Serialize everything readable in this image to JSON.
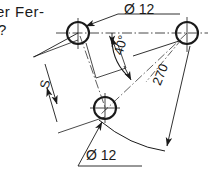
{
  "drawing": {
    "type": "engineering-dimension-drawing",
    "background_color": "#ffffff",
    "line_color": "#1a1a1a",
    "width": 209,
    "height": 178,
    "truncated_text": {
      "line1": "er Fer-",
      "line2": "?"
    },
    "labels": {
      "diameter_top": "Ø 12",
      "diameter_bottom": "Ø 12",
      "angle": "40°",
      "distance": "270",
      "dimension_s": "S"
    },
    "holes": [
      {
        "name": "hole-top-left",
        "cx": 78,
        "cy": 33,
        "r": 11,
        "diameter": "12"
      },
      {
        "name": "hole-top-right",
        "cx": 187,
        "cy": 33,
        "r": 11,
        "diameter": "12"
      },
      {
        "name": "hole-bottom",
        "cx": 105,
        "cy": 108,
        "r": 11,
        "diameter": "12"
      }
    ],
    "dimensions": [
      {
        "name": "angle-dimension",
        "value": "40°",
        "kind": "angular"
      },
      {
        "name": "radius-dimension",
        "value": "270",
        "kind": "radial"
      },
      {
        "name": "length-dimension",
        "value": "S",
        "kind": "linear"
      }
    ]
  }
}
